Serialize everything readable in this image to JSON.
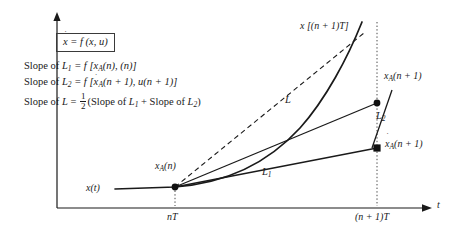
{
  "figure": {
    "type": "diagram",
    "equation_box": {
      "lhs": "x",
      "lhs_accent": "dot",
      "text": "= f (x, u)"
    },
    "legend_lines": [
      {
        "prefix": "Slope of ",
        "symbol": "L",
        "symbol_sub": "1",
        "rhs": " = f [x",
        "rhs_sub": "A",
        "rhs_tail": "(n), (n)]"
      },
      {
        "prefix": "Slope of ",
        "symbol": "L",
        "symbol_sub": "2",
        "rhs": " = f [x",
        "rhs_sub": "A",
        "rhs_tail": "(n + 1), u(n + 1)]"
      },
      {
        "prefix": "Slope of ",
        "symbol": "L",
        "symbol_sub": "",
        "rhs": " = ",
        "fraction_num": "1",
        "fraction_den": "2",
        "rhs_tail": "(Slope of L1 + Slope of L2)"
      }
    ],
    "axes": {
      "x_axis_label": "t",
      "y_axis_label": "",
      "ticks": [
        {
          "name": "nT",
          "label": "nT"
        },
        {
          "name": "(n+1)T",
          "label": "(n + 1)T"
        }
      ]
    },
    "annotations": {
      "exact_solution_top": "x [(n + 1)T]",
      "start_point": "x",
      "start_point_sub": "A",
      "start_point_tail": "(n)",
      "trajectory": "x(t)",
      "corrected_point": "x",
      "corrected_point_sub": "A",
      "corrected_point_tail": "(n + 1)",
      "predicted_point": "x",
      "predicted_point_sub": "A",
      "predicted_point_tail": "(n + 1)",
      "predicted_point_accent": "dot",
      "line_L": "L",
      "line_L1": "L",
      "line_L1_sub": "1",
      "line_L2": "L",
      "line_L2_sub": "2"
    },
    "colors": {
      "stroke": "#1a1a1a",
      "background": "#ffffff",
      "dotted": "#555555"
    }
  }
}
